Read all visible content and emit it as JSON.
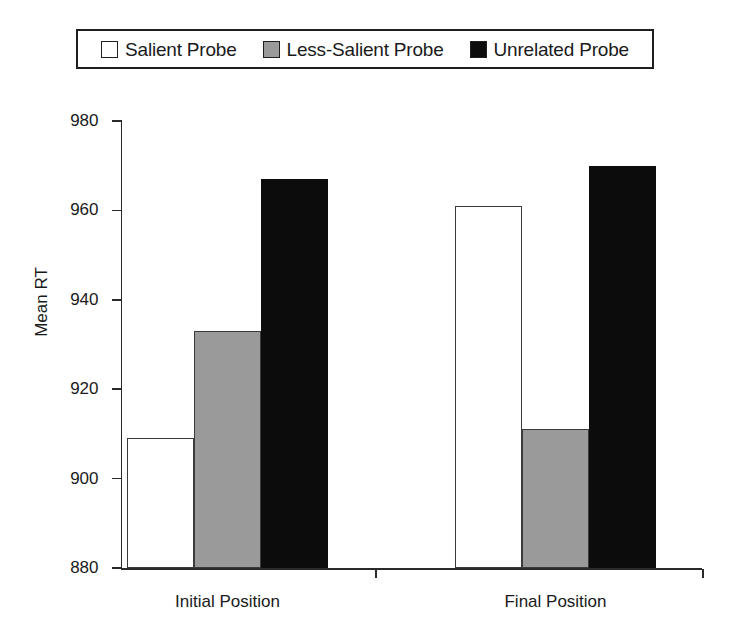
{
  "chart_data": {
    "type": "bar",
    "title": "",
    "xlabel": "",
    "ylabel": "Mean RT",
    "ylim": [
      880,
      980
    ],
    "ytick_labels": [
      "980",
      "960",
      "940",
      "920",
      "900",
      "880"
    ],
    "yticks": [
      980,
      960,
      940,
      920,
      900,
      880
    ],
    "grid": false,
    "legend_position": "top",
    "categories": [
      "Initial Position",
      "Final Position"
    ],
    "series": [
      {
        "name": "Salient Probe",
        "swatch": "#ffffff",
        "values": [
          909,
          961
        ]
      },
      {
        "name": "Less-Salient Probe",
        "swatch": "#9a9a9a",
        "values": [
          933,
          911
        ]
      },
      {
        "name": "Unrelated Probe",
        "swatch": "#0c0c0c",
        "values": [
          967,
          970
        ]
      }
    ]
  },
  "legend": {
    "entries": [
      {
        "label": "Salient Probe"
      },
      {
        "label": "Less-Salient Probe"
      },
      {
        "label": "Unrelated Probe"
      }
    ]
  },
  "axes": {
    "y_title": "Mean RT",
    "y_ticks": [
      {
        "label": "980"
      },
      {
        "label": "960"
      },
      {
        "label": "940"
      },
      {
        "label": "920"
      },
      {
        "label": "900"
      },
      {
        "label": "880"
      }
    ],
    "x_groups": [
      {
        "label": "Initial Position"
      },
      {
        "label": "Final Position"
      }
    ]
  }
}
